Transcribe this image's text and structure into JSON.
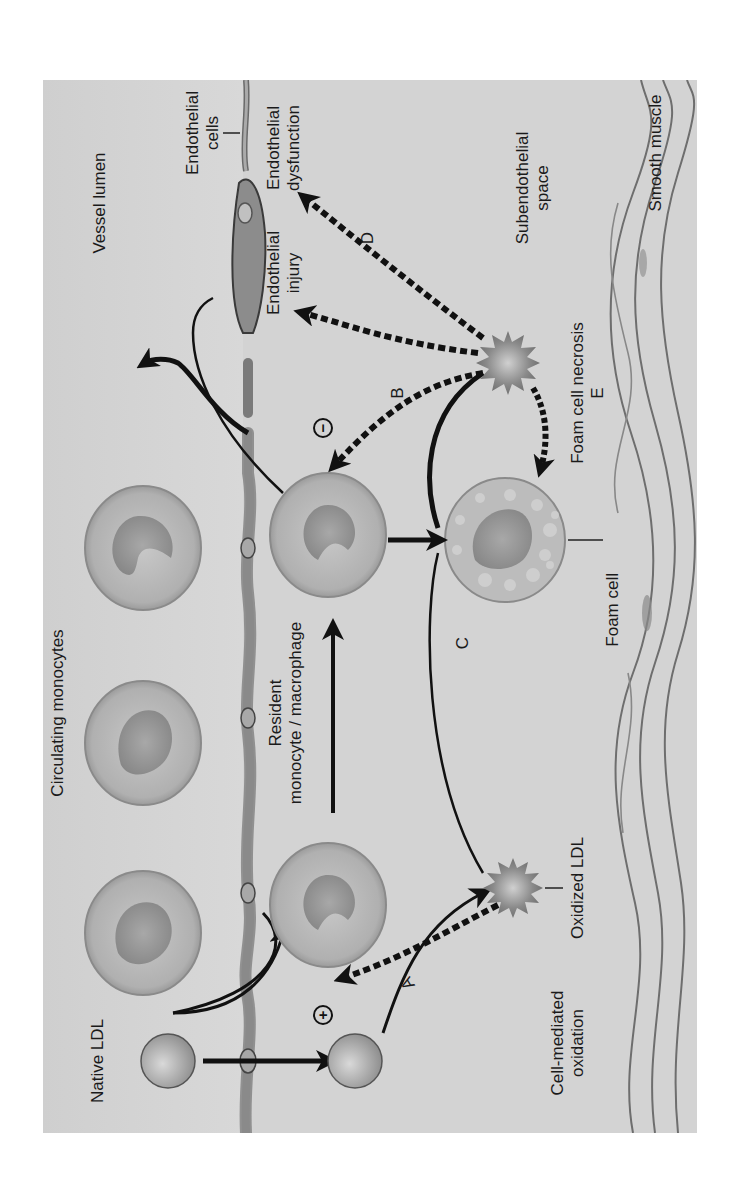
{
  "diagram": {
    "regions": {
      "vessel_lumen": "Vessel lumen",
      "subendothelial_space_1": "Subendothelial",
      "subendothelial_space_2": "space",
      "smooth_muscle": "Smooth muscle",
      "endothelial_cells_1": "Endothelial",
      "endothelial_cells_2": "cells"
    },
    "labels": {
      "native_ldl": "Native LDL",
      "circulating_monocytes": "Circulating monocytes",
      "resident_1": "Resident",
      "resident_2": "monocyte / macrophage",
      "cell_mediated_1": "Cell-mediated",
      "cell_mediated_2": "oxidation",
      "oxidized_ldl": "Oxidized LDL",
      "foam_cell": "Foam cell",
      "foam_cell_necrosis": "Foam cell necrosis",
      "endothelial_injury_1": "Endothelial",
      "endothelial_injury_2": "injury",
      "endothelial_dysfunction_1": "Endothelial",
      "endothelial_dysfunction_2": "dysfunction"
    },
    "pathway_letters": {
      "a": "A",
      "b": "B",
      "c": "C",
      "d": "D",
      "e": "E"
    },
    "signs": {
      "plus": "+",
      "minus": "−"
    },
    "colors": {
      "background": "#d2d2d2",
      "arrow": "#111111",
      "cell_fill": "#bdbdbd",
      "cell_edge": "#7a7a7a",
      "nucleus": "#9c9c9c",
      "endothelium": "#8a8a8a",
      "star": "#7d7d7d"
    },
    "orientation": "rotated 90 degrees counter-clockwise"
  }
}
